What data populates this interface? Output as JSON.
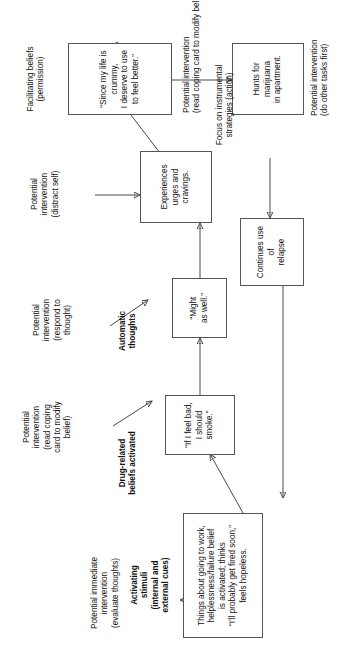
{
  "diagram": {
    "type": "flowchart",
    "orientation": "landscape page shown rotated 90 degrees counter-clockwise",
    "nodes": [
      {
        "id": "activating",
        "text": "Things about going to work,\nhelplessness/failure belief\nis activated; thinks\n“I’ll probably get fired soon,”\nfeels hopeless."
      },
      {
        "id": "drug-belief",
        "text": "“If I feel bad,\nI should smoke.”"
      },
      {
        "id": "automatic-thought",
        "text": "“Might\nas well.”"
      },
      {
        "id": "urges",
        "text": "Experiences\nurges and\ncravings."
      },
      {
        "id": "facilitating-belief",
        "text": "“Since my life is crummy,\nI deserve to use to feel better.”"
      },
      {
        "id": "instrumental",
        "text": "Hunts for marijuana\nin apartment."
      },
      {
        "id": "relapse",
        "text": "Continues use of\nrelapse"
      }
    ],
    "stage_labels": [
      {
        "id": "stage-activating",
        "text": "Activating\nstimuli\n(internal and\nexternal cues)"
      },
      {
        "id": "stage-drug-beliefs",
        "text": "Drug-related\nbeliefs activated"
      },
      {
        "id": "stage-automatic-thoughts",
        "text": "Automatic\nthoughts"
      },
      {
        "id": "stage-facilitating-beliefs",
        "text": "Facilitating beliefs\n(permission)"
      },
      {
        "id": "stage-instrumental",
        "text": "Focus on instrumental\nstrategies (action)"
      }
    ],
    "intervention_labels": [
      {
        "id": "intervention-evaluate-thoughts",
        "text": "Potential immediate\nintervention\n(evaluate thoughts)"
      },
      {
        "id": "intervention-coping-card-belief",
        "text": "Potential\nintervention\n(read coping\ncard to modify\nbelief)"
      },
      {
        "id": "intervention-respond-to-thought",
        "text": "Potential\nintervention\n(respond to\nthought)"
      },
      {
        "id": "intervention-distract-self",
        "text": "Potential\nintervention\n(distract self)"
      },
      {
        "id": "intervention-coping-card-modify",
        "text": "Potential intervention\n(read coping card to modify belief)"
      },
      {
        "id": "intervention-other-tasks",
        "text": "Potential intervention\n(do other tasks first)"
      }
    ]
  }
}
